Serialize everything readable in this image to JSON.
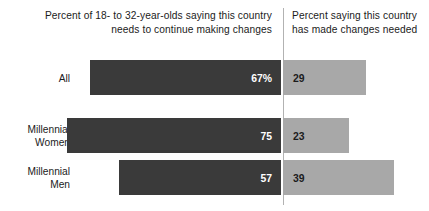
{
  "header": {
    "left_title": "Percent of 18- to 32-year-olds saying this country needs to continue making changes",
    "right_title": "Percent saying this country has made changes needed"
  },
  "colors": {
    "left_bar": "#3a3a3a",
    "right_bar": "#a8a8a8",
    "divider": "#b2b2b2",
    "left_value_text": "#ffffff",
    "right_value_text": "#1b1b1b",
    "background": "#ffffff"
  },
  "rows": [
    {
      "label_line1": "All",
      "label_line2": "",
      "left_value": 67,
      "left_value_label": "67%",
      "right_value": 29,
      "right_value_label": "29"
    },
    {
      "label_line1": "Millennial",
      "label_line2": "Women",
      "left_value": 75,
      "left_value_label": "75",
      "right_value": 23,
      "right_value_label": "23"
    },
    {
      "label_line1": "Millennial",
      "label_line2": "Men",
      "left_value": 57,
      "left_value_label": "57",
      "right_value": 39,
      "right_value_label": "39"
    }
  ],
  "chart_data": {
    "type": "bar",
    "orientation": "horizontal",
    "layout": "diverging-stacked",
    "title": "",
    "subtitle": "",
    "xlabel": "",
    "ylabel": "",
    "categories": [
      "All",
      "Millennial Women",
      "Millennial Men"
    ],
    "series": [
      {
        "name": "Percent of 18- to 32-year-olds saying this country needs to continue making changes",
        "short_name": "Needs to continue making changes",
        "values": [
          67,
          75,
          57
        ],
        "value_labels": [
          "67%",
          "75",
          "57"
        ],
        "color": "#3a3a3a",
        "side": "left"
      },
      {
        "name": "Percent saying this country has made changes needed",
        "short_name": "Has made changes needed",
        "values": [
          29,
          23,
          39
        ],
        "value_labels": [
          "29",
          "23",
          "39"
        ],
        "color": "#a8a8a8",
        "side": "right"
      }
    ],
    "units": "percent",
    "grid": false,
    "legend_position": "top",
    "axis_visible": false,
    "divider_at_zero": true
  }
}
